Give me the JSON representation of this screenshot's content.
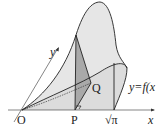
{
  "diagram": {
    "type": "3d-solid-cross-section",
    "labels": {
      "origin": "O",
      "point_p": "P",
      "point_q": "Q",
      "x_axis": "x",
      "y_axis": "y",
      "sqrt_pi": "√π",
      "curve": "y=f(x",
      "right_angle_mark": "⌐"
    },
    "colors": {
      "surface_fill": "#e6e6e6",
      "cross_section_fill": "#a9a9a9",
      "lines": "#222222",
      "background": "#ffffff"
    }
  }
}
